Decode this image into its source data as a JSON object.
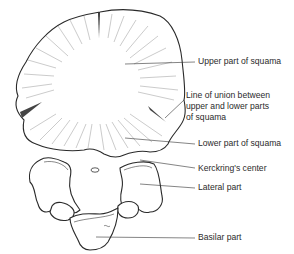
{
  "figure": {
    "labels": [
      {
        "id": "upper-squama",
        "lines": [
          "Upper part of squama"
        ]
      },
      {
        "id": "line-of-union",
        "lines": [
          "Line of union between",
          "upper and lower parts",
          "of squama"
        ]
      },
      {
        "id": "lower-squama",
        "lines": [
          "Lower part of squama"
        ]
      },
      {
        "id": "kerckring",
        "lines": [
          "Kerckring's center"
        ]
      },
      {
        "id": "lateral-part",
        "lines": [
          "Lateral part"
        ]
      },
      {
        "id": "basilar-part",
        "lines": [
          "Basilar part"
        ]
      }
    ]
  }
}
